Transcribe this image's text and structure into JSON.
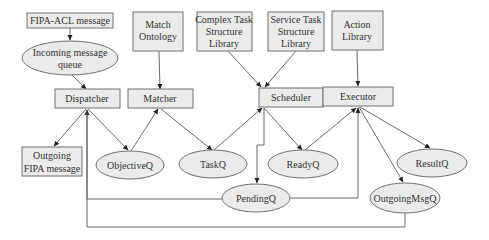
{
  "diagram": {
    "type": "architecture-flow",
    "nodes": {
      "fipa_acl": {
        "shape": "rect",
        "lines": [
          "FIPA-ACL message"
        ]
      },
      "incoming_queue": {
        "shape": "ellipse",
        "lines": [
          "Incoming message",
          "queue"
        ]
      },
      "dispatcher": {
        "shape": "rect",
        "lines": [
          "Dispatcher"
        ]
      },
      "match_ontology": {
        "shape": "rect",
        "lines": [
          "Match",
          "Ontology"
        ]
      },
      "matcher": {
        "shape": "rect",
        "lines": [
          "Matcher"
        ]
      },
      "complex_task_lib": {
        "shape": "rect",
        "lines": [
          "Complex Task",
          "Structure",
          "Library"
        ]
      },
      "service_task_lib": {
        "shape": "rect",
        "lines": [
          "Service Task",
          "Structure",
          "Library"
        ]
      },
      "scheduler": {
        "shape": "rect",
        "lines": [
          "Scheduler"
        ]
      },
      "action_library": {
        "shape": "rect",
        "lines": [
          "Action",
          "Library"
        ]
      },
      "executor": {
        "shape": "rect",
        "lines": [
          "Executor"
        ]
      },
      "outgoing_fipa": {
        "shape": "rect",
        "lines": [
          "Outgoing",
          "FIPA message"
        ]
      },
      "objective_q": {
        "shape": "ellipse",
        "lines": [
          "ObjectiveQ"
        ]
      },
      "task_q": {
        "shape": "ellipse",
        "lines": [
          "TaskQ"
        ]
      },
      "ready_q": {
        "shape": "ellipse",
        "lines": [
          "ReadyQ"
        ]
      },
      "result_q": {
        "shape": "ellipse",
        "lines": [
          "ResultQ"
        ]
      },
      "pending_q": {
        "shape": "ellipse",
        "lines": [
          "PendingQ"
        ]
      },
      "outgoing_msg_q": {
        "shape": "ellipse",
        "lines": [
          "OutgoingMsgQ"
        ]
      }
    },
    "edges": [
      {
        "from": "fipa_acl",
        "to": "incoming_queue"
      },
      {
        "from": "incoming_queue",
        "to": "dispatcher"
      },
      {
        "from": "match_ontology",
        "to": "matcher"
      },
      {
        "from": "complex_task_lib",
        "to": "scheduler"
      },
      {
        "from": "service_task_lib",
        "to": "scheduler"
      },
      {
        "from": "action_library",
        "to": "executor"
      },
      {
        "from": "dispatcher",
        "to": "outgoing_fipa"
      },
      {
        "from": "dispatcher",
        "to": "objective_q"
      },
      {
        "from": "objective_q",
        "to": "matcher"
      },
      {
        "from": "matcher",
        "to": "task_q"
      },
      {
        "from": "task_q",
        "to": "scheduler"
      },
      {
        "from": "scheduler",
        "to": "ready_q"
      },
      {
        "from": "scheduler",
        "to": "pending_q"
      },
      {
        "from": "ready_q",
        "to": "executor"
      },
      {
        "from": "executor",
        "to": "result_q"
      },
      {
        "from": "executor",
        "to": "outgoing_msg_q"
      },
      {
        "from": "pending_q",
        "to": "dispatcher"
      },
      {
        "from": "pending_q",
        "to": "executor"
      },
      {
        "from": "outgoing_msg_q",
        "to": "dispatcher"
      }
    ]
  }
}
